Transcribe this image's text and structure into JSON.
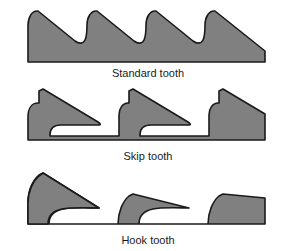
{
  "figure": {
    "background_color": "#ffffff",
    "blade_fill_color": "#808080",
    "blade_outline_color": "#1a1a1a",
    "caption_color": "#1a1a1a"
  },
  "bands": [
    {
      "id": "standard",
      "caption": "Standard tooth",
      "tooth_count": 5,
      "tooth_pitch_px": 48,
      "gullet_shape": "deep-rounded-u",
      "rake_face": "steep-straight",
      "peak_y_px": 10,
      "baseline_y_px": 62,
      "left_edge_x_px": 28,
      "right_edge_x_px": 265,
      "path": "M 28,62 L 28,25 C 28,16 33,10 37,10 L 38,10 L 76,40 C 79,43 82,44 85,41 C 88,38 87,31 87,25 C 87,16 92,10 96,10 L 97,10 L 135,40 C 138,43 141,44 144,41 C 147,38 146,31 146,25 C 146,16 151,10 155,10 L 156,10 L 194,40 C 197,43 200,44 203,41 C 206,38 205,31 205,25 C 205,16 210,10 214,10 L 215,10 L 265,48 L 265,62 Z"
    },
    {
      "id": "skip",
      "caption": "Skip tooth",
      "tooth_count": 3,
      "tooth_pitch_px": 80,
      "gullet_shape": "flat-bottom-rounded-corners",
      "rake_face": "near-vertical",
      "peak_y_px": 4,
      "baseline_y_px": 57,
      "left_edge_x_px": 28,
      "right_edge_x_px": 265,
      "path": "M 28,57 L 28,32 C 28,23 33,18 38,18 L 39,18 L 39,6 L 44,4 L 92,34 C 95,36 96,38 96,41 L 96,41 C 96,41 96,41 93,41 L 52,41 C 45,41 41,44 41,49 L 41,57 Z",
      "path_full": "M 28,57 L 28,33 C 28,24 33,19 38,19 L 39,19 L 39,5 L 43,4 L 98,38 C 101,40 102,42 102,44 L 102,44 L 61,44 C 54,44 50,47 50,52 L 50,57 Z"
    },
    {
      "id": "hook",
      "caption": "Hook tooth",
      "tooth_count": 3,
      "tooth_pitch_px": 80,
      "gullet_shape": "wide-rounded-hook",
      "rake_face": "concave-curved",
      "peak_y_px": 4,
      "baseline_y_px": 57,
      "left_edge_x_px": 28,
      "right_edge_x_px": 265,
      "path": "M 28,57 L 28,34 C 28,22 34,12 40,7 L 44,4 L 100,40 L 100,40 C 92,40 70,40 62,42 C 52,44 48,50 48,57 Z"
    }
  ]
}
